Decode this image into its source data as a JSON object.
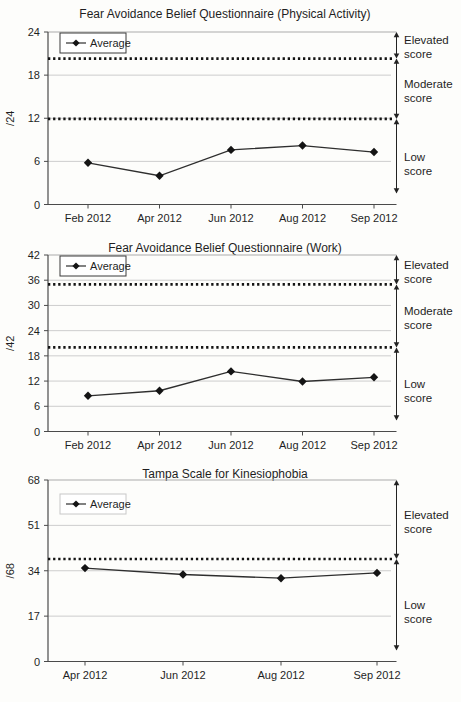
{
  "page": {
    "background": "#fdfdfb"
  },
  "colors": {
    "line": "#2e2e2e",
    "marker": "#141414",
    "grid": "#cdcdcd",
    "plot_top_border": "#ababab",
    "threshold": "#141414",
    "axis": "#4a4a4a",
    "text": "#1f1f1f",
    "arrow": "#222222",
    "legend_border_dark": "#3a3a3a",
    "legend_border_light": "#c8c8c8"
  },
  "chart_data": [
    {
      "type": "line",
      "title": "Fear Avoidance Belief Questionnaire (Physical Activity)",
      "ylabel": "/24",
      "ylim": [
        0,
        24
      ],
      "yticks": [
        0,
        6,
        12,
        18,
        24
      ],
      "grid": "horizontal",
      "categories": [
        "Feb 2012",
        "Apr 2012",
        "Jun 2012",
        "Aug 2012",
        "Sep 2012"
      ],
      "series": [
        {
          "name": "Average",
          "values": [
            5.8,
            4.0,
            7.6,
            8.2,
            7.3
          ]
        }
      ],
      "thresholds": [
        20.3,
        11.9
      ],
      "zone_labels": [
        "Elevated score",
        "Moderate score",
        "Low score"
      ],
      "legend": {
        "label": "Average",
        "position": "top-left",
        "border": "dark"
      }
    },
    {
      "type": "line",
      "title": "Fear Avoidance Belief Questionnaire (Work)",
      "ylabel": "/42",
      "ylim": [
        0,
        42
      ],
      "yticks": [
        0,
        6,
        12,
        18,
        24,
        30,
        36,
        42
      ],
      "grid": "horizontal",
      "categories": [
        "Feb 2012",
        "Apr 2012",
        "Jun 2012",
        "Aug 2012",
        "Sep 2012"
      ],
      "series": [
        {
          "name": "Average",
          "values": [
            8.5,
            9.7,
            14.3,
            11.9,
            12.9
          ]
        }
      ],
      "thresholds": [
        35.0,
        20.0
      ],
      "zone_labels": [
        "Elevated score",
        "Moderate score",
        "Low score"
      ],
      "legend": {
        "label": "Average",
        "position": "top-left",
        "border": "dark"
      }
    },
    {
      "type": "line",
      "title": "Tampa Scale for Kinesiophobia",
      "ylabel": "/68",
      "ylim": [
        0,
        68
      ],
      "yticks": [
        0,
        17,
        34,
        51,
        68
      ],
      "grid": "horizontal",
      "categories": [
        "Apr 2012",
        "Jun 2012",
        "Aug 2012",
        "Sep 2012"
      ],
      "series": [
        {
          "name": "Average",
          "values": [
            35.0,
            32.6,
            31.2,
            33.2
          ]
        }
      ],
      "thresholds": [
        38.4
      ],
      "zone_labels": [
        "Elevated score",
        "Low score"
      ],
      "legend": {
        "label": "Average",
        "position": "top-left",
        "border": "light"
      }
    }
  ]
}
